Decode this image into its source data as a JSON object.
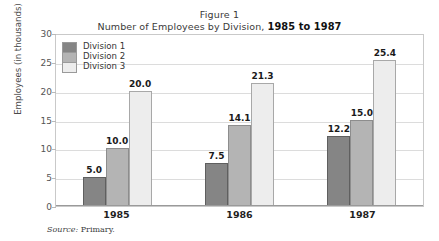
{
  "figure": {
    "title_line1": "Figure 1",
    "title_line2_prefix": "Number of Employees by Division,",
    "title_years": "1985 to 1987",
    "source_key": "Source:",
    "source_value": "Primary."
  },
  "chart_data": {
    "type": "bar",
    "xlabel": "",
    "ylabel": "Employees (in thousands)",
    "categories": [
      "1985",
      "1986",
      "1987"
    ],
    "series": [
      {
        "name": "Division 1",
        "color": "#858585",
        "values": [
          5.0,
          7.5,
          12.2
        ]
      },
      {
        "name": "Division 2",
        "color": "#b4b4b4",
        "values": [
          10.0,
          14.1,
          15.0
        ]
      },
      {
        "name": "Division 3",
        "color": "#ededed",
        "values": [
          20.0,
          21.3,
          25.4
        ]
      }
    ],
    "labels": {
      "1985": [
        "5.0",
        "10.0",
        "20.0"
      ],
      "1986": [
        "7.5",
        "14.1",
        "21.3"
      ],
      "1987": [
        "12.2",
        "15.0",
        "25.4"
      ]
    },
    "ylim": [
      0,
      30
    ],
    "yticks": [
      30,
      25,
      20,
      15,
      10,
      5,
      0
    ],
    "ytick_labels": [
      "30",
      "25",
      "20",
      "15",
      "10",
      "5",
      "0"
    ],
    "grid": true,
    "legend_position": "top-left-inside"
  }
}
